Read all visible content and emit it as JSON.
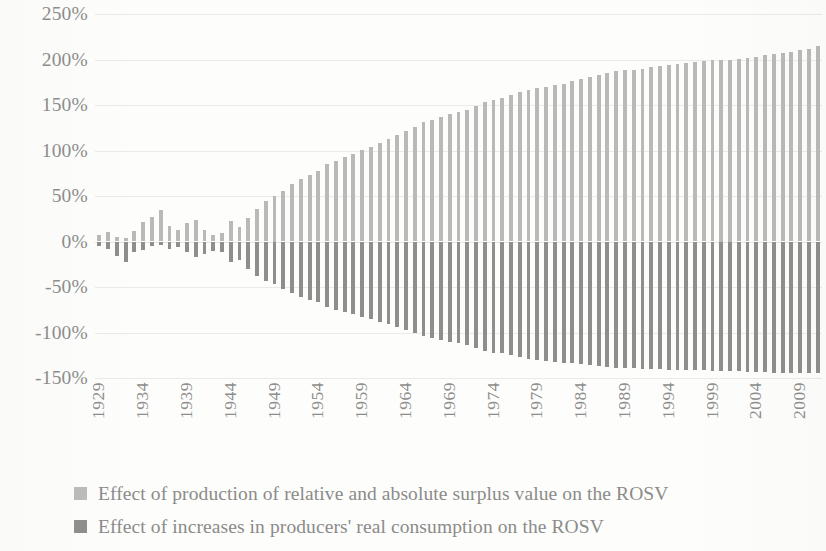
{
  "chart_data": {
    "type": "bar",
    "title": "",
    "subtitle": "",
    "xlabel": "",
    "ylabel": "",
    "grid": true,
    "legend_position": "bottom-left",
    "ylim": [
      -150,
      250
    ],
    "yticks": [
      250,
      200,
      150,
      100,
      50,
      0,
      -50,
      -100,
      -150
    ],
    "ytick_labels": [
      "250%",
      "200%",
      "150%",
      "100%",
      "50%",
      "0%",
      "-50%",
      "-100%",
      "-150%"
    ],
    "xtick_labels": [
      "1929",
      "1934",
      "1939",
      "1944",
      "1949",
      "1954",
      "1959",
      "1964",
      "1969",
      "1974",
      "1979",
      "1984",
      "1989",
      "1994",
      "1999",
      "2004",
      "2009"
    ],
    "xtick_step": 5,
    "x": [
      1929,
      1930,
      1931,
      1932,
      1933,
      1934,
      1935,
      1936,
      1937,
      1938,
      1939,
      1940,
      1941,
      1942,
      1943,
      1944,
      1945,
      1946,
      1947,
      1948,
      1949,
      1950,
      1951,
      1952,
      1953,
      1954,
      1955,
      1956,
      1957,
      1958,
      1959,
      1960,
      1961,
      1962,
      1963,
      1964,
      1965,
      1966,
      1967,
      1968,
      1969,
      1970,
      1971,
      1972,
      1973,
      1974,
      1975,
      1976,
      1977,
      1978,
      1979,
      1980,
      1981,
      1982,
      1983,
      1984,
      1985,
      1986,
      1987,
      1988,
      1989,
      1990,
      1991,
      1992,
      1993,
      1994,
      1995,
      1996,
      1997,
      1998,
      1999,
      2000,
      2001,
      2002,
      2003,
      2004,
      2005,
      2006,
      2007,
      2008,
      2009,
      2010,
      2011
    ],
    "series": [
      {
        "name": "Effect of production of relative and absolute surplus value on the ROSV",
        "color": "#b9b9b7",
        "values": [
          7,
          10,
          5,
          4,
          11,
          21,
          27,
          35,
          17,
          13,
          20,
          24,
          13,
          7,
          9,
          22,
          16,
          26,
          36,
          44,
          50,
          56,
          63,
          69,
          73,
          78,
          85,
          89,
          93,
          96,
          101,
          104,
          108,
          113,
          117,
          121,
          126,
          131,
          134,
          137,
          140,
          142,
          145,
          149,
          153,
          156,
          158,
          161,
          164,
          167,
          169,
          170,
          172,
          173,
          176,
          179,
          181,
          183,
          185,
          187,
          188,
          189,
          190,
          192,
          193,
          194,
          195,
          196,
          197,
          198,
          199,
          200,
          200,
          201,
          202,
          203,
          205,
          206,
          207,
          208,
          210,
          212,
          215
        ]
      },
      {
        "name": "Effect of increases in producers' real consumption on the ROSV",
        "color": "#8e8e8c",
        "values": [
          -5,
          -8,
          -16,
          -22,
          -12,
          -9,
          -5,
          -4,
          -8,
          -6,
          -12,
          -17,
          -14,
          -10,
          -12,
          -22,
          -20,
          -30,
          -38,
          -43,
          -47,
          -52,
          -57,
          -61,
          -64,
          -67,
          -72,
          -75,
          -78,
          -80,
          -83,
          -85,
          -88,
          -91,
          -94,
          -97,
          -100,
          -104,
          -106,
          -108,
          -110,
          -112,
          -114,
          -117,
          -120,
          -122,
          -123,
          -125,
          -127,
          -129,
          -130,
          -131,
          -132,
          -133,
          -134,
          -135,
          -136,
          -137,
          -138,
          -139,
          -139,
          -139,
          -140,
          -140,
          -140,
          -141,
          -141,
          -141,
          -141,
          -141,
          -142,
          -142,
          -142,
          -142,
          -143,
          -143,
          -143,
          -144,
          -144,
          -144,
          -145,
          -145,
          -145
        ]
      }
    ]
  },
  "legend": {
    "items": [
      {
        "label": "Effect of production of relative and absolute surplus value on the ROSV",
        "swatch": "light-gray-swatch"
      },
      {
        "label": "Effect of increases in producers' real consumption on the ROSV",
        "swatch": "dark-gray-swatch"
      }
    ]
  },
  "colors": {
    "positive_series": "#b9b9b7",
    "negative_series": "#8e8e8c",
    "gridline": "#eceae6",
    "text": "#8b8b89",
    "background": "#fdfdfc"
  }
}
